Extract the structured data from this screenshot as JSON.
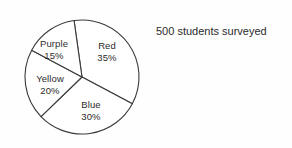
{
  "caption": {
    "text": "500 students surveyed"
  },
  "chart_data": {
    "type": "pie",
    "title": "",
    "subtitle": "",
    "xlabel": "",
    "ylabel": "",
    "total_label": "500 students surveyed",
    "total": 500,
    "units": "percent",
    "legend_position": "none",
    "labels_inside_slices": true,
    "start_angle_deg": -8,
    "direction": "clockwise",
    "categories": [
      "Red",
      "Blue",
      "Yellow",
      "Purple"
    ],
    "values": [
      35,
      30,
      20,
      15
    ],
    "slices": [
      {
        "name": "Red",
        "value": 35,
        "percent_label": "35%",
        "count": 175,
        "fill": "#ffffff",
        "stroke": "#3a3a3a"
      },
      {
        "name": "Blue",
        "value": 30,
        "percent_label": "30%",
        "count": 150,
        "fill": "#ffffff",
        "stroke": "#3a3a3a"
      },
      {
        "name": "Yellow",
        "value": 20,
        "percent_label": "20%",
        "count": 100,
        "fill": "#ffffff",
        "stroke": "#3a3a3a"
      },
      {
        "name": "Purple",
        "value": 15,
        "percent_label": "15%",
        "count": 75,
        "fill": "#ffffff",
        "stroke": "#3a3a3a"
      }
    ]
  },
  "geometry": {
    "center_x": 82,
    "center_y": 77,
    "radius": 57
  },
  "colors": {
    "background": "#fefefe",
    "outline": "#3a3a3a",
    "text": "#2b2b2b"
  }
}
